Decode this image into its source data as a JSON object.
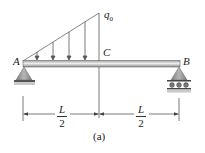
{
  "figure": {
    "caption": "(a)",
    "labels": {
      "load_magnitude": "q",
      "load_subscript": "0",
      "point_a": "A",
      "point_b": "B",
      "point_c": "C"
    },
    "dimensions": [
      {
        "numerator": "L",
        "denominator": "2",
        "span": "A to C"
      },
      {
        "numerator": "L",
        "denominator": "2",
        "span": "C to B"
      }
    ],
    "load": {
      "type": "triangular distributed load",
      "from": "A",
      "to": "C",
      "max_value_label": "q0",
      "arrow_count": 4
    },
    "supports": [
      {
        "point": "A",
        "type": "pin"
      },
      {
        "point": "B",
        "type": "roller"
      }
    ],
    "colors": {
      "beam": "#c8c8c8",
      "beam_highlight": "#eeeeee",
      "beam_edge": "#555555",
      "support_fill": "#9a9a9a",
      "ground": "#8c8c8c",
      "line": "#444444"
    }
  }
}
